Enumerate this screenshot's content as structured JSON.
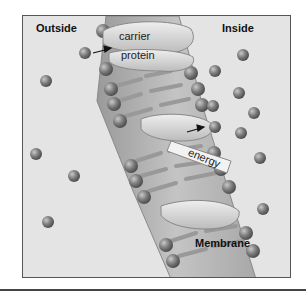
{
  "diagram": {
    "type": "active-transport-membrane",
    "labels": {
      "outside": "Outside",
      "inside": "Inside",
      "carrier_line1": "carrier",
      "carrier_line2": "protein",
      "energy": "energy",
      "membrane": "Membrane"
    },
    "colors": {
      "background": "#e4e4e4",
      "membrane": "#b8b8b8",
      "membrane_dark": "#8f8f8f",
      "molecule": "#7a7a7a",
      "frame": "#555555"
    },
    "molecules": {
      "outside": [
        [
          84,
          52
        ],
        [
          45,
          80
        ],
        [
          35,
          153
        ],
        [
          73,
          175
        ],
        [
          47,
          221
        ]
      ],
      "inside": [
        [
          242,
          54
        ],
        [
          214,
          70
        ],
        [
          238,
          92
        ],
        [
          212,
          105
        ],
        [
          253,
          112
        ],
        [
          214,
          126
        ],
        [
          240,
          132
        ],
        [
          259,
          157
        ],
        [
          262,
          208
        ]
      ]
    }
  }
}
